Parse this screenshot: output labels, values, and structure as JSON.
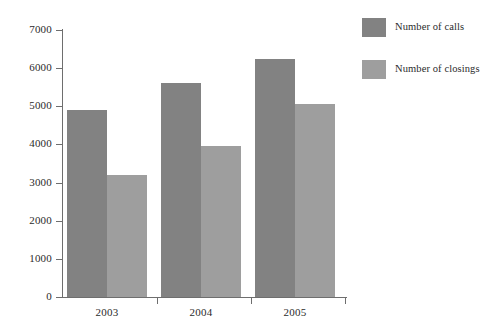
{
  "chart_data": {
    "type": "bar",
    "title": "",
    "subtitle": "",
    "xlabel": "",
    "ylabel": "",
    "categories": [
      "2003",
      "2004",
      "2005"
    ],
    "series": [
      {
        "name": "Number of calls",
        "color": "#828282",
        "values": [
          4900,
          5600,
          6250
        ]
      },
      {
        "name": "Number of closings",
        "color": "#9e9e9e",
        "values": [
          3200,
          3950,
          5050
        ]
      }
    ],
    "ylim": [
      0,
      7000
    ],
    "ytick_values": [
      0,
      1000,
      2000,
      3000,
      4000,
      5000,
      6000,
      7000
    ],
    "ytick_labels": [
      "0",
      "1000",
      "2000",
      "3000",
      "4000",
      "5000",
      "6000",
      "7000"
    ],
    "grid": false,
    "legend_position": "right",
    "annotations": []
  },
  "colors": {
    "calls": "#828282",
    "closings": "#9e9e9e",
    "axis": "#6e6e6e",
    "text": "#2b2b2b",
    "background": "#ffffff"
  }
}
